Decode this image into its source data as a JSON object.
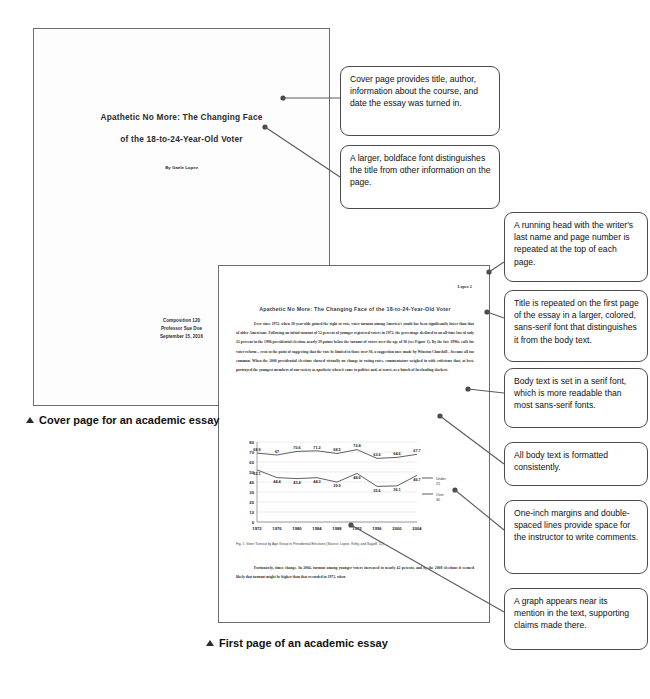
{
  "cover_page": {
    "title_line1": "Apathetic No More: The Changing Face",
    "title_line2": "of the 18-to-24-Year-Old Voter",
    "author": "By Gaele Lopez",
    "course": "Composition 120",
    "instructor": "Professor Sue Doe",
    "date": "September 15, 2016",
    "caption": "Cover page for an academic essay"
  },
  "essay_page": {
    "running_head": "Lopez 2",
    "title": "Apathetic No More: The Changing Face of the 18-to-24-Year-Old Voter",
    "paragraph1": "Ever since 1972, when 18-year-olds gained the right to vote, voter turnout among America's youth has been significantly lower than that of older Americans. Following an initial turnout of 52 percent of younger registered voters in 1972, the percentage declined to an all-time low of only 32 percent in the 1996 presidential election, nearly 39 points below the turnout of voters over the age of 30 (see Figure 1). By the late 1990s, calls for voter reform – even to the point of suggesting that the vote be limited to those over 30, a suggestion once made by Winston Churchill – became all too common. When the 2000 presidential elections showed virtually no change in voting rates, commentators weighed in with criticisms that, at best, portrayed the youngest members of our society as apathetic when it came to politics and, at worst, as a bunch of freeloading slackers.",
    "figure_caption": "Fig. 1. Voter Turnout by Age Group in Presidential Elections  (Source: Lopez, Kirby, and Sagoff, 12)",
    "paragraph2": "Fortunately, times change. In 2004, turnout among younger voters increased to nearly 42 percent, and by the 2008 elections it seemed likely that turnout might be higher than that recorded in 1972, when",
    "caption": "First page of an academic essay"
  },
  "chart_data": {
    "type": "line",
    "title": "",
    "xlabel": "",
    "ylabel": "",
    "categories": [
      "1972",
      "1976",
      "1980",
      "1984",
      "1988",
      "1992",
      "1996",
      "2000",
      "2004"
    ],
    "ylim": [
      0,
      80
    ],
    "yticks": [
      0,
      10,
      20,
      30,
      40,
      50,
      60,
      70,
      80
    ],
    "grid": true,
    "legend_position": "right",
    "series": [
      {
        "name": "Under 25",
        "values": [
          52.1,
          44.4,
          43.4,
          44.3,
          39.9,
          48.6,
          35.6,
          36.1,
          46.7
        ]
      },
      {
        "name": "Over 30",
        "values": [
          68.9,
          67.0,
          70.6,
          71.2,
          68.5,
          72.4,
          63.6,
          64.6,
          67.7
        ]
      }
    ],
    "legend": [
      "Under 25",
      "Over 30"
    ]
  },
  "callouts": [
    {
      "id": "cover-title-author-note",
      "text": "Cover page provides title, author, information about the course, and date the essay was turned in."
    },
    {
      "id": "boldface-font-note",
      "text": "A larger, boldface font distinguishes the title from other information on the page."
    },
    {
      "id": "running-head-note",
      "text": "A running head with the writer's last name and page number is repeated at the top of each page."
    },
    {
      "id": "title-repeat-note",
      "text": "Title is repeated on the first page of the essay in a larger, colored, sans-serif font that distinguishes it from the body text."
    },
    {
      "id": "serif-body-note",
      "text": "Body text is set in a serif font, which is more readable than most sans-serif fonts."
    },
    {
      "id": "consistent-format-note",
      "text": "All body text is formatted consistently."
    },
    {
      "id": "margins-spacing-note",
      "text": "One-inch margins and double-spaced lines provide space for the instructor to write comments."
    },
    {
      "id": "graph-placement-note",
      "text": "A graph appears near its mention in the text, supporting claims made there."
    }
  ]
}
